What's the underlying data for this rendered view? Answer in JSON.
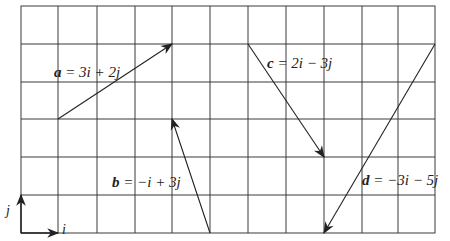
{
  "diagram": {
    "title": "",
    "grid": {
      "columns": 11,
      "rows": 6,
      "x0": 21,
      "y0": 6,
      "cell_w": 37.6,
      "cell_h": 37.8,
      "line_color": "#333333"
    },
    "vectors": [
      {
        "name": "a",
        "label": "a = 3i + 2j",
        "from": [
          1,
          3
        ],
        "to": [
          4,
          5
        ],
        "components": [
          3,
          2
        ]
      },
      {
        "name": "b",
        "label": "b = −i + 3j",
        "from": [
          5,
          0
        ],
        "to": [
          4,
          3
        ],
        "components": [
          -1,
          3
        ]
      },
      {
        "name": "c",
        "label": "c = 2i − 3j",
        "from": [
          6,
          5
        ],
        "to": [
          8,
          2
        ],
        "components": [
          2,
          -3
        ]
      },
      {
        "name": "d",
        "label": "d = −3i − 5j",
        "from": [
          11,
          5
        ],
        "to": [
          8,
          0
        ],
        "components": [
          -3,
          -5
        ]
      }
    ],
    "unit_vectors": {
      "i_label": "i",
      "j_label": "j"
    },
    "labels": {
      "a_name": "a",
      "a_expr": " = 3i + 2j",
      "b_name": "b",
      "b_expr": " = −i + 3j",
      "c_name": "c",
      "c_expr": " = 2i − 3j",
      "d_name": "d",
      "d_expr": " = −3i − 5j"
    }
  }
}
